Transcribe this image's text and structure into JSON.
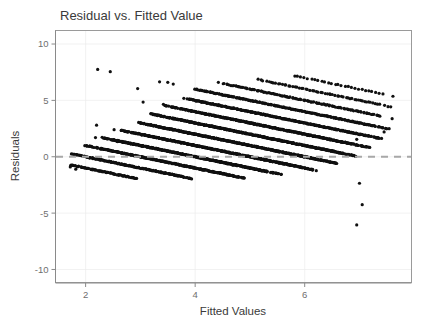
{
  "figure": {
    "width": 431,
    "height": 327,
    "background": "#ffffff"
  },
  "chart_data": {
    "type": "scatter",
    "title": "Residual vs. Fitted Value",
    "xlabel": "Fitted Values",
    "ylabel": "Residuals",
    "xlim": [
      1.45,
      7.95
    ],
    "ylim": [
      -11.2,
      11.2
    ],
    "xticks": [
      2,
      4,
      6
    ],
    "xtick_labels": [
      "2",
      "4",
      "6"
    ],
    "yticks": [
      10,
      5,
      0,
      -5,
      -10
    ],
    "ytick_labels": [
      "10",
      "5",
      "0",
      "-5",
      "-10"
    ],
    "grid": true,
    "legend": "none",
    "point_color": "#101010",
    "point_size": 1.6,
    "reference_line": {
      "name": "zero-residual-line",
      "orientation": "horizontal",
      "y": 0,
      "style": "dashed",
      "color": "#a8a8a8",
      "width": 2
    },
    "band_slope": -1.0,
    "bands": [
      {
        "level": 1,
        "intercept": 1.0,
        "x_start": 1.7,
        "x_end": 2.95,
        "density": 0.55
      },
      {
        "level": 2,
        "intercept": 2.0,
        "x_start": 1.75,
        "x_end": 3.95,
        "density": 0.7
      },
      {
        "level": 3,
        "intercept": 3.0,
        "x_start": 2.0,
        "x_end": 4.9,
        "density": 0.85
      },
      {
        "level": 4,
        "intercept": 4.0,
        "x_start": 2.3,
        "x_end": 5.6,
        "density": 1.0
      },
      {
        "level": 5,
        "intercept": 5.0,
        "x_start": 2.65,
        "x_end": 6.2,
        "density": 1.0
      },
      {
        "level": 6,
        "intercept": 6.0,
        "x_start": 2.95,
        "x_end": 6.6,
        "density": 1.0
      },
      {
        "level": 7,
        "intercept": 7.0,
        "x_start": 3.2,
        "x_end": 6.95,
        "density": 0.95
      },
      {
        "level": 8,
        "intercept": 8.0,
        "x_start": 3.45,
        "x_end": 7.2,
        "density": 0.85
      },
      {
        "level": 9,
        "intercept": 9.0,
        "x_start": 3.75,
        "x_end": 7.4,
        "density": 0.7
      },
      {
        "level": 10,
        "intercept": 10.0,
        "x_start": 3.95,
        "x_end": 7.55,
        "density": 0.55
      },
      {
        "level": 11,
        "intercept": 11.0,
        "x_start": 4.4,
        "x_end": 7.6,
        "density": 0.35
      },
      {
        "level": 12,
        "intercept": 12.0,
        "x_start": 5.05,
        "x_end": 7.6,
        "density": 0.22
      },
      {
        "level": 13,
        "intercept": 13.0,
        "x_start": 5.75,
        "x_end": 7.6,
        "density": 0.14
      }
    ],
    "outliers": [
      {
        "x": 2.22,
        "y": 7.75
      },
      {
        "x": 2.45,
        "y": 7.55
      },
      {
        "x": 2.95,
        "y": 6.05
      },
      {
        "x": 3.35,
        "y": 6.65
      },
      {
        "x": 3.5,
        "y": 6.6
      },
      {
        "x": 3.6,
        "y": 6.45
      },
      {
        "x": 3.05,
        "y": 4.85
      },
      {
        "x": 3.42,
        "y": 4.65
      },
      {
        "x": 2.2,
        "y": 2.8
      },
      {
        "x": 2.18,
        "y": 1.7
      },
      {
        "x": 2.52,
        "y": 2.4
      },
      {
        "x": 2.58,
        "y": 1.35
      },
      {
        "x": 7.45,
        "y": 2.2
      },
      {
        "x": 6.95,
        "y": 1.55
      },
      {
        "x": 7.0,
        "y": -2.35
      },
      {
        "x": 7.05,
        "y": -4.25
      },
      {
        "x": 6.95,
        "y": -6.05
      },
      {
        "x": 1.72,
        "y": -0.9
      },
      {
        "x": 1.82,
        "y": -1.1
      }
    ],
    "n_points_approx": 1600
  }
}
